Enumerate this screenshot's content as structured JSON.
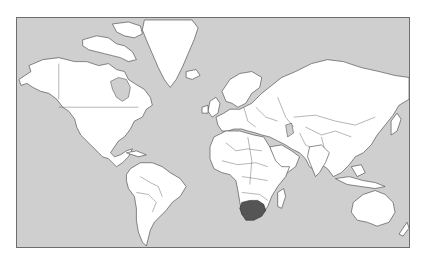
{
  "map": {
    "title": "",
    "projection": "Mercator",
    "highlighted_country": "South Africa",
    "colors": {
      "ocean": "#cfcfcf",
      "land": "#ffffff",
      "border": "#3c3c3c",
      "highlight": "#555555",
      "frame": "#6e6e6e",
      "page_background": "#ffffff"
    },
    "regions": [
      {
        "name": "North America"
      },
      {
        "name": "Greenland"
      },
      {
        "name": "South America"
      },
      {
        "name": "Europe"
      },
      {
        "name": "Africa"
      },
      {
        "name": "Asia"
      },
      {
        "name": "Australia"
      },
      {
        "name": "South Africa",
        "highlighted": true
      }
    ]
  }
}
